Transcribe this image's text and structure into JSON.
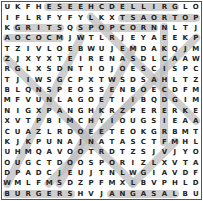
{
  "puzzle": {
    "rows": 19,
    "cols": 19,
    "grid": [
      "UKFHESEEHCDELLIRGLO",
      "IFLRFYFYLKXTSAORTOP",
      "KGRITSQSPOPCORNNLTJ",
      "AOCOCMJWTLRJEYAEEKP",
      "TZIVLOEBWUJEMDAKQJM",
      "ZJXYXTEIRENASDLCAAW",
      "RGLXSDNTIOJOESCISPC",
      "TJIWSGCPXTWSDSAHLTZ",
      "BLQNSPEOSSENBOECDFM",
      "MFVUNLAGOETIIBQDGIM",
      "NIGXPANGHKRZPERERKE",
      "XVTPBIMCHYIOUGSIEAA",
      "CUAZLRDOEETEOKGRBMT",
      "KJKPUNAJNATASCTFMHL",
      "UHMQAVOOTRDTZSJVJYO",
      "OUGCTDOOSPORIZLXVTA",
      "DPADCJEUJTNLWGIAVDF",
      "WMLFMSDZPFMXLBVPHLD",
      "BURGERSHVJANGASALBU"
    ],
    "highlights": [
      {
        "word": "GRILLED CHEESE",
        "r1": 1,
        "c1": 17,
        "r2": 1,
        "c2": 5
      },
      {
        "word": "POT ROAST",
        "r1": 2,
        "c1": 19,
        "r2": 2,
        "c2": 12
      },
      {
        "word": "GRITS",
        "r1": 3,
        "c1": 2,
        "r2": 3,
        "c2": 6
      },
      {
        "word": "POPCORN",
        "r1": 3,
        "c1": 8,
        "r2": 3,
        "c2": 15
      },
      {
        "word": "BURGERS",
        "r1": 19,
        "c1": 1,
        "r2": 19,
        "c2": 7
      },
      {
        "word": "LASAGNA",
        "r1": 19,
        "c1": 17,
        "r2": 19,
        "c2": 11
      },
      {
        "word": "ACOCM",
        "r1": 4,
        "c1": 1,
        "r2": 4,
        "c2": 6
      },
      {
        "word": "VERTICAL-16",
        "r1": 3,
        "c1": 16,
        "r2": 14,
        "c2": 16
      },
      {
        "word": "DIAG-A",
        "r1": 2,
        "c1": 9,
        "r2": 12,
        "c2": 19
      },
      {
        "word": "DIAG-B",
        "r1": 4,
        "c1": 8,
        "r2": 18,
        "c2": 1
      },
      {
        "word": "DIAG-C",
        "r1": 5,
        "c1": 13,
        "r2": 18,
        "c2": 6
      },
      {
        "word": "DIAG-D",
        "r1": 4,
        "c1": 19,
        "r2": 13,
        "c2": 10
      },
      {
        "word": "DIAG-E",
        "r1": 6,
        "c1": 1,
        "r2": 14,
        "c2": 9
      },
      {
        "word": "DIAG-F",
        "r1": 10,
        "c1": 13,
        "r2": 18,
        "c2": 5
      },
      {
        "word": "DIAG-G",
        "r1": 12,
        "c1": 7,
        "r2": 18,
        "c2": 13
      },
      {
        "word": "DIAG-H",
        "r1": 14,
        "c1": 17,
        "r2": 18,
        "c2": 13
      }
    ],
    "colors": {
      "highlight": "#bdbdbd",
      "text": "#222222",
      "border": "#555555"
    }
  }
}
